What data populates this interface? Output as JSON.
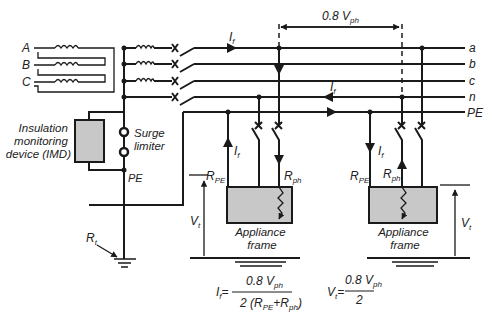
{
  "diagram": {
    "sources": [
      "A",
      "B",
      "C"
    ],
    "conductors": [
      "a",
      "b",
      "c",
      "n",
      "PE"
    ],
    "imd_label": [
      "Insulation",
      "monitoring",
      "device (IMD)"
    ],
    "surge_label": [
      "Surge",
      "limiter"
    ],
    "pe_label": "PE",
    "earth_label": "R",
    "earth_sub": "t",
    "fault_current": "I",
    "fault_sub": "f",
    "dimension_label": "0.8 V",
    "dimension_sub": "ph",
    "rpe_label": "R",
    "rpe_sub": "PE",
    "rph_label": "R",
    "rph_sub": "ph",
    "vt_label": "V",
    "vt_sub": "t",
    "appliance_label": [
      "Appliance",
      "frame"
    ],
    "formula_if": {
      "lhs": "I",
      "lhs_sub": "f",
      "numerator": "0.8 V",
      "numerator_sub": "ph",
      "denominator_pre": "2 (R",
      "denominator_sub1": "PE",
      "denominator_mid": "+R",
      "denominator_sub2": "ph",
      "denominator_post": ")"
    },
    "formula_vt": {
      "lhs": "V",
      "lhs_sub": "t",
      "numerator": "0.8 V",
      "numerator_sub": "ph",
      "denominator": "2"
    },
    "colors": {
      "line": "#1a1a1a",
      "box_fill": "#c8c8c8",
      "background": "#ffffff"
    }
  }
}
